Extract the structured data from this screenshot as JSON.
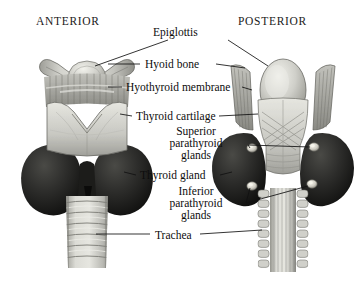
{
  "figure": {
    "background_color": "#ffffff",
    "width": 356,
    "height": 283
  },
  "headings": {
    "anterior": "ANTERIOR",
    "posterior": "POSTERIOR"
  },
  "labels": {
    "epiglottis": "Epiglottis",
    "hyoid_bone": "Hyoid bone",
    "hyothyroid_membrane": "Hyothyroid membrane",
    "thyroid_cartilage": "Thyroid cartilage",
    "superior_parathyroid_glands": {
      "line1": "Superior",
      "line2": "parathyroid",
      "line3": "glands"
    },
    "thyroid_gland": "Thyroid gland",
    "inferior_parathyroid_glands": {
      "line1": "Inferior",
      "line2": "parathyroid",
      "line3": "glands"
    },
    "trachea": "Trachea"
  },
  "colors": {
    "background": "#ffffff",
    "leader_line": "#111111",
    "text": "#0d0d0d",
    "thyroid_gland_dark": "#2a2a2a",
    "thyroid_gland_shadow": "#141414",
    "cartilage_light": "#d8d8d4",
    "cartilage_mid": "#b4b4ae",
    "cartilage_shade": "#8c8c86",
    "membrane_gray": "#9a9a94",
    "parathyroid_gland": "#e8e6de",
    "trachea_ring": "#c6c6c0",
    "outline": "#4a4a46"
  }
}
